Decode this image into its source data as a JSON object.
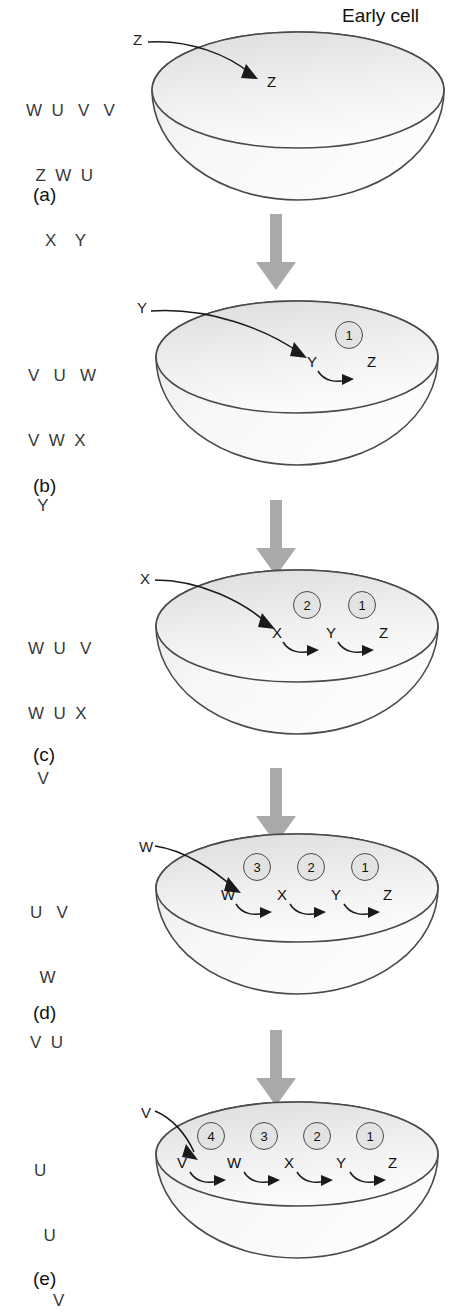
{
  "figure": {
    "title_label": "Early cell",
    "domain": "retrograde-evolution-of-a-metabolic-pathway",
    "metabolite_letters": [
      "U",
      "V",
      "W",
      "X",
      "Y",
      "Z"
    ],
    "connector_arrow_color": "#a9a9a9",
    "cell_outline_color": "#4a4a4a",
    "enzyme_circle_fill": "#e3e3e3",
    "enzyme_circle_stroke": "#4a4a4a"
  },
  "panels": [
    {
      "id": "a",
      "label": "(a)",
      "external_rows": [
        "W  U   V   V",
        "  Z  W  U",
        "    X    Y"
      ],
      "imported_substrate": "Z",
      "source_label": "Z",
      "chain": [
        {
          "metabolite": "Z"
        }
      ],
      "enzymes": [],
      "has_early_cell_label": true
    },
    {
      "id": "b",
      "label": "(b)",
      "external_rows": [
        "V   U   W",
        "V  W  X",
        "  Y"
      ],
      "imported_substrate": "Y",
      "source_label": "Y",
      "chain": [
        {
          "metabolite": "Y"
        },
        {
          "metabolite": "Z"
        }
      ],
      "enzymes": [
        "1"
      ],
      "has_early_cell_label": false
    },
    {
      "id": "c",
      "label": "(c)",
      "external_rows": [
        "W  U   V",
        "W  U  X",
        "  V"
      ],
      "imported_substrate": "X",
      "source_label": "X",
      "chain": [
        {
          "metabolite": "X"
        },
        {
          "metabolite": "Y"
        },
        {
          "metabolite": "Z"
        }
      ],
      "enzymes": [
        "2",
        "1"
      ],
      "has_early_cell_label": false
    },
    {
      "id": "d",
      "label": "(d)",
      "external_rows": [
        "U   V",
        "  W",
        "V  U"
      ],
      "imported_substrate": "W",
      "source_label": "W",
      "chain": [
        {
          "metabolite": "W"
        },
        {
          "metabolite": "X"
        },
        {
          "metabolite": "Y"
        },
        {
          "metabolite": "Z"
        }
      ],
      "enzymes": [
        "3",
        "2",
        "1"
      ],
      "has_early_cell_label": false
    },
    {
      "id": "e",
      "label": "(e)",
      "external_rows": [
        "U",
        "  U",
        "    V"
      ],
      "imported_substrate": "V",
      "source_label": "V",
      "chain": [
        {
          "metabolite": "V"
        },
        {
          "metabolite": "W"
        },
        {
          "metabolite": "X"
        },
        {
          "metabolite": "Y"
        },
        {
          "metabolite": "Z"
        }
      ],
      "enzymes": [
        "4",
        "3",
        "2",
        "1"
      ],
      "has_early_cell_label": false
    }
  ]
}
